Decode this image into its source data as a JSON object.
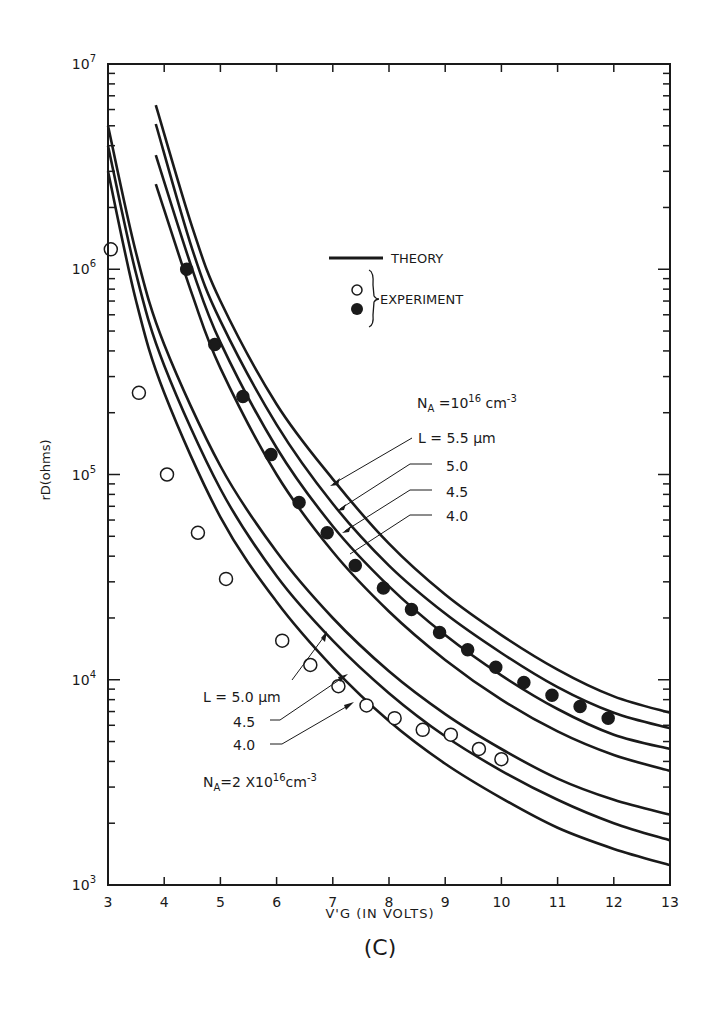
{
  "chart_data": {
    "type": "line",
    "title": "",
    "panel_label": "(C)",
    "xlabel": "V'G (IN VOLTS)",
    "ylabel": "rD(ohms)",
    "xlim": [
      3,
      13
    ],
    "ylim": [
      1000,
      10000000
    ],
    "yscale": "log",
    "x_ticks": [
      3,
      4,
      5,
      6,
      7,
      8,
      9,
      10,
      11,
      12,
      13
    ],
    "y_ticks": [
      {
        "value": 1000,
        "label": "10",
        "exp": "3"
      },
      {
        "value": 10000,
        "label": "10",
        "exp": "4"
      },
      {
        "value": 100000,
        "label": "10",
        "exp": "5"
      },
      {
        "value": 1000000,
        "label": "10",
        "exp": "6"
      },
      {
        "value": 10000000,
        "label": "10",
        "exp": "7"
      }
    ],
    "grid": false,
    "legend": {
      "theory": "THEORY",
      "experiment": "EXPERIMENT"
    },
    "groups": [
      {
        "name": "NA = 10^16 cm^-3",
        "label_main": "N",
        "label_sub": "A",
        "label_rest": " =10",
        "label_sup": "16",
        "label_unit": " cm",
        "label_unit_sup": "-3",
        "curve_labels": [
          "L = 5.5 μm",
          "5.0",
          "4.5",
          "4.0"
        ],
        "series": [
          {
            "name": "L = 5.5 μm (theory)",
            "x": [
              3.85,
              4.5,
              5,
              6,
              7,
              8,
              9,
              10,
              11,
              12,
              13
            ],
            "y": [
              6300000,
              1600000,
              700000,
              220000,
              95000,
              46000,
              26000,
              16500,
              11200,
              8300,
              6900
            ]
          },
          {
            "name": "L = 5.0 μm (theory)",
            "x": [
              3.85,
              4.5,
              5,
              6,
              7,
              8,
              9,
              10,
              11,
              12,
              13
            ],
            "y": [
              5100000,
              1250000,
              560000,
              175000,
              72000,
              36000,
              21000,
              13500,
              9200,
              6900,
              5800
            ]
          },
          {
            "name": "L = 4.5 μm (theory)",
            "x": [
              3.85,
              4.5,
              5,
              6,
              7,
              8,
              9,
              10,
              11,
              12,
              13
            ],
            "y": [
              3600000,
              1000000,
              440000,
              135000,
              56000,
              28500,
              16500,
              10500,
              7200,
              5400,
              4600
            ]
          },
          {
            "name": "L = 4.0 μm (theory)",
            "x": [
              3.85,
              4.5,
              5,
              6,
              7,
              8,
              9,
              10,
              11,
              12,
              13
            ],
            "y": [
              2600000,
              750000,
              330000,
              100000,
              42000,
              21500,
              12500,
              8000,
              5600,
              4300,
              3600
            ]
          },
          {
            "name": "Experiment (filled)",
            "marker": "filled",
            "x": [
              4.4,
              4.9,
              5.4,
              5.9,
              6.4,
              6.9,
              7.4,
              7.9,
              8.4,
              8.9,
              9.4,
              9.9,
              10.4,
              10.9,
              11.4,
              11.9
            ],
            "y": [
              1000000,
              430000,
              240000,
              125000,
              73000,
              52000,
              36000,
              28000,
              22000,
              17000,
              14000,
              11500,
              9700,
              8400,
              7400,
              6500
            ]
          }
        ]
      },
      {
        "name": "NA = 2 x 10^16 cm^-3",
        "label_main": "N",
        "label_sub": "A",
        "label_rest": "=2 X10",
        "label_sup": "16",
        "label_unit": "cm",
        "label_unit_sup": "-3",
        "curve_labels": [
          "L = 5.0 μm",
          "4.5",
          "4.0"
        ],
        "series": [
          {
            "name": "L = 5.0 μm (theory)",
            "x": [
              3.0,
              3.5,
              4,
              5,
              6,
              7,
              8,
              9,
              10,
              11,
              12,
              13
            ],
            "y": [
              5000000,
              1200000,
              430000,
              110000,
              42000,
              20000,
              11000,
              6800,
              4600,
              3300,
              2600,
              2200
            ]
          },
          {
            "name": "L = 4.5 μm (theory)",
            "x": [
              3.0,
              3.5,
              4,
              5,
              6,
              7,
              8,
              9,
              10,
              11,
              12,
              13
            ],
            "y": [
              4000000,
              950000,
              340000,
              85000,
              32000,
              15500,
              8600,
              5300,
              3600,
              2600,
              2000,
              1650
            ]
          },
          {
            "name": "L = 4.0 μm (theory)",
            "x": [
              3.0,
              3.5,
              4,
              5,
              6,
              7,
              8,
              9,
              10,
              11,
              12,
              13
            ],
            "y": [
              3000000,
              700000,
              250000,
              62000,
              24000,
              11500,
              6300,
              3900,
              2650,
              1900,
              1500,
              1250
            ]
          },
          {
            "name": "Experiment (open)",
            "marker": "open",
            "x": [
              3.05,
              3.55,
              4.05,
              4.6,
              5.1,
              6.1,
              6.6,
              7.1,
              7.6,
              8.1,
              8.6,
              9.1,
              9.6,
              10.0
            ],
            "y": [
              1250000,
              250000,
              100000,
              52000,
              31000,
              15500,
              11800,
              9300,
              7500,
              6500,
              5700,
              5400,
              4600,
              4100
            ]
          }
        ]
      }
    ]
  }
}
